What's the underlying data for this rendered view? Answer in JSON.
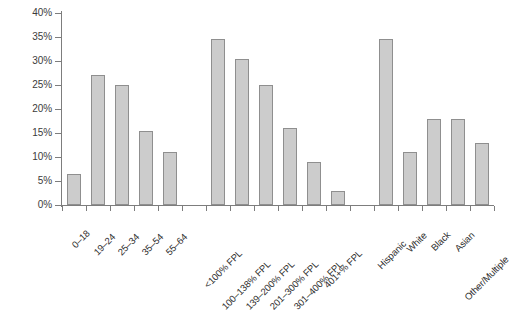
{
  "chart_data": {
    "type": "bar",
    "title": "",
    "xlabel": "",
    "ylabel": "",
    "ylim": [
      0,
      40
    ],
    "ytick_labels": [
      "0%",
      "5%",
      "10%",
      "15%",
      "20%",
      "25%",
      "30%",
      "35%",
      "40%"
    ],
    "ytick_values": [
      0,
      5,
      10,
      15,
      20,
      25,
      30,
      35,
      40
    ],
    "grid": false,
    "legend": "none",
    "value_suffix": "%",
    "groups": [
      {
        "name": "Age",
        "categories": [
          "0–18",
          "19–24",
          "25–34",
          "35–54",
          "55–64"
        ],
        "values": [
          6.5,
          27,
          25,
          15.5,
          11
        ]
      },
      {
        "name": "Income (FPL)",
        "categories": [
          "<100% FPL",
          "100–138% FPL",
          "139–200% FPL",
          "201–300% FPL",
          "301–400% FPL",
          "401+% FPL"
        ],
        "values": [
          34.5,
          30.5,
          25,
          16,
          9,
          3
        ]
      },
      {
        "name": "Race/Ethnicity",
        "categories": [
          "Hispanic",
          "White",
          "Black",
          "Asian",
          "Other/Multiple"
        ],
        "values": [
          34.5,
          11,
          18,
          18,
          13
        ]
      }
    ],
    "categories": [
      "0–18",
      "19–24",
      "25–34",
      "35–54",
      "55–64",
      "<100% FPL",
      "100–138% FPL",
      "139–200% FPL",
      "201–300% FPL",
      "301–400% FPL",
      "401+% FPL",
      "Hispanic",
      "White",
      "Black",
      "Asian",
      "Other/Multiple"
    ],
    "values": [
      6.5,
      27,
      25,
      15.5,
      11,
      34.5,
      30.5,
      25,
      16,
      9,
      3,
      34.5,
      11,
      18,
      18,
      13
    ],
    "bar_fill": "#cccccc",
    "bar_border": "#8f8f8f",
    "axis_color": "#7d7d7d"
  }
}
